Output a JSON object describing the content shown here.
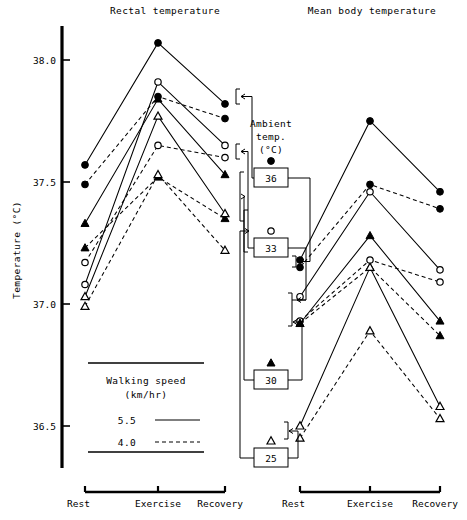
{
  "figure": {
    "axis": {
      "ylabel": "Temperature  (°C)",
      "ticks": [
        {
          "label": "38.0",
          "value": 38.0,
          "y": 60
        },
        {
          "label": "37.5",
          "value": 37.5,
          "y": 182
        },
        {
          "label": "37.0",
          "value": 37.0,
          "y": 304
        },
        {
          "label": "36.5",
          "value": 36.5,
          "y": 426
        }
      ],
      "ymin": 36.35,
      "ymax": 38.15
    },
    "panels": [
      {
        "id": "rectal",
        "title": "Rectal temperature",
        "x_ticks": [
          "Rest",
          "Exercise",
          "Recovery"
        ],
        "x_positions": [
          85,
          158,
          225
        ]
      },
      {
        "id": "mean-body",
        "title": "Mean body temperature",
        "x_ticks": [
          "Rest",
          "Exercise",
          "Recovery"
        ],
        "x_positions": [
          300,
          370,
          440
        ]
      }
    ],
    "annotation": {
      "line1": "Ambient",
      "line2": "temp.",
      "line3": "(°C)"
    },
    "ambient_boxes": [
      {
        "label": "36",
        "marker": "filled-circle",
        "x": 270,
        "y": 178
      },
      {
        "label": "33",
        "marker": "open-circle",
        "x": 270,
        "y": 248
      },
      {
        "label": "30",
        "marker": "filled-triangle",
        "x": 270,
        "y": 380
      },
      {
        "label": "25",
        "marker": "open-triangle",
        "x": 270,
        "y": 458
      }
    ],
    "legend": {
      "title_line1": "Walking speed",
      "title_line2": "(km/hr)",
      "entries": [
        {
          "label": "5.5",
          "style": "solid"
        },
        {
          "label": "4.0",
          "style": "dashed"
        }
      ]
    }
  },
  "chart_data": {
    "type": "line",
    "xlabel": "",
    "ylabel": "Temperature (°C)",
    "categories": [
      "Rest",
      "Exercise",
      "Recovery"
    ],
    "ylim": [
      36.35,
      38.15
    ],
    "yticks": [
      36.5,
      37.0,
      37.5,
      38.0
    ],
    "grid": false,
    "legend_position": "lower-left inset",
    "legend_entries": [
      {
        "name": "5.5 km/hr",
        "line": "solid"
      },
      {
        "name": "4.0 km/hr",
        "line": "dashed"
      }
    ],
    "marker_key": [
      {
        "ambient_temp_C": 36,
        "marker": "filled-circle"
      },
      {
        "ambient_temp_C": 33,
        "marker": "open-circle"
      },
      {
        "ambient_temp_C": 30,
        "marker": "filled-triangle"
      },
      {
        "ambient_temp_C": 25,
        "marker": "open-triangle"
      }
    ],
    "panels": [
      {
        "name": "Rectal temperature",
        "series": [
          {
            "name": "36°C, 5.5 km/hr",
            "ambient_temp_C": 36,
            "speed_km_h": 5.5,
            "marker": "filled-circle",
            "line": "solid",
            "values": [
              37.57,
              38.07,
              37.82
            ]
          },
          {
            "name": "36°C, 4.0 km/hr",
            "ambient_temp_C": 36,
            "speed_km_h": 4.0,
            "marker": "filled-circle",
            "line": "dashed",
            "values": [
              37.49,
              37.85,
              37.76
            ]
          },
          {
            "name": "33°C, 5.5 km/hr",
            "ambient_temp_C": 33,
            "speed_km_h": 5.5,
            "marker": "open-circle",
            "line": "solid",
            "values": [
              37.08,
              37.91,
              37.65
            ]
          },
          {
            "name": "33°C, 4.0 km/hr",
            "ambient_temp_C": 33,
            "speed_km_h": 4.0,
            "marker": "open-circle",
            "line": "dashed",
            "values": [
              37.17,
              37.65,
              37.6
            ]
          },
          {
            "name": "30°C, 5.5 km/hr",
            "ambient_temp_C": 30,
            "speed_km_h": 5.5,
            "marker": "filled-triangle",
            "line": "solid",
            "values": [
              37.33,
              37.84,
              37.53
            ]
          },
          {
            "name": "30°C, 4.0 km/hr",
            "ambient_temp_C": 30,
            "speed_km_h": 4.0,
            "marker": "filled-triangle",
            "line": "dashed",
            "values": [
              37.23,
              37.52,
              37.35
            ]
          },
          {
            "name": "25°C, 5.5 km/hr",
            "ambient_temp_C": 25,
            "speed_km_h": 5.5,
            "marker": "open-triangle",
            "line": "solid",
            "values": [
              37.03,
              37.77,
              37.37
            ]
          },
          {
            "name": "25°C, 4.0 km/hr",
            "ambient_temp_C": 25,
            "speed_km_h": 4.0,
            "marker": "open-triangle",
            "line": "dashed",
            "values": [
              36.99,
              37.53,
              37.22
            ]
          }
        ]
      },
      {
        "name": "Mean body temperature",
        "series": [
          {
            "name": "36°C, 5.5 km/hr",
            "ambient_temp_C": 36,
            "speed_km_h": 5.5,
            "marker": "filled-circle",
            "line": "solid",
            "values": [
              37.18,
              37.75,
              37.46
            ]
          },
          {
            "name": "36°C, 4.0 km/hr",
            "ambient_temp_C": 36,
            "speed_km_h": 4.0,
            "marker": "filled-circle",
            "line": "dashed",
            "values": [
              37.15,
              37.49,
              37.39
            ]
          },
          {
            "name": "33°C, 5.5 km/hr",
            "ambient_temp_C": 33,
            "speed_km_h": 5.5,
            "marker": "open-circle",
            "line": "solid",
            "values": [
              37.03,
              37.46,
              37.14
            ]
          },
          {
            "name": "33°C, 4.0 km/hr",
            "ambient_temp_C": 33,
            "speed_km_h": 4.0,
            "marker": "open-circle",
            "line": "dashed",
            "values": [
              36.93,
              37.18,
              37.09
            ]
          },
          {
            "name": "30°C, 5.5 km/hr",
            "ambient_temp_C": 30,
            "speed_km_h": 5.5,
            "marker": "filled-triangle",
            "line": "solid",
            "values": [
              36.92,
              37.28,
              36.93
            ]
          },
          {
            "name": "30°C, 4.0 km/hr",
            "ambient_temp_C": 30,
            "speed_km_h": 4.0,
            "marker": "filled-triangle",
            "line": "dashed",
            "values": [
              36.92,
              37.15,
              36.87
            ]
          },
          {
            "name": "25°C, 5.5 km/hr",
            "ambient_temp_C": 25,
            "speed_km_h": 5.5,
            "marker": "open-triangle",
            "line": "solid",
            "values": [
              36.5,
              37.15,
              36.58
            ]
          },
          {
            "name": "25°C, 4.0 km/hr",
            "ambient_temp_C": 25,
            "speed_km_h": 4.0,
            "marker": "open-triangle",
            "line": "dashed",
            "values": [
              36.45,
              36.89,
              36.53
            ]
          }
        ]
      }
    ]
  }
}
